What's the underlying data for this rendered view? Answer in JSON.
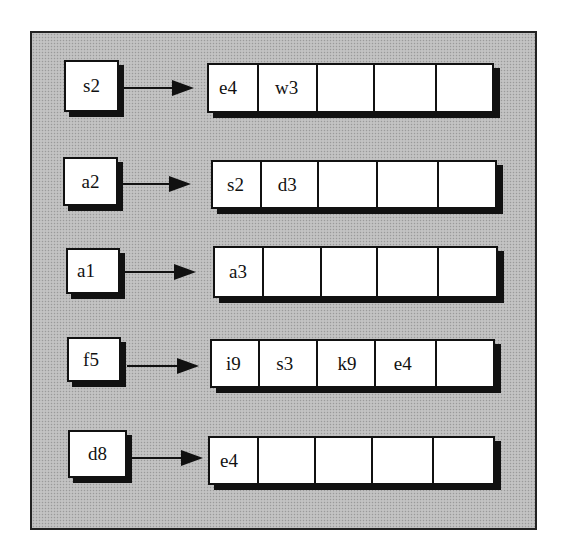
{
  "diagram": {
    "type": "hash-table-bucket-lists",
    "rows": [
      {
        "key": "s2",
        "cells": [
          "e4",
          "w3",
          "",
          "",
          ""
        ]
      },
      {
        "key": "a2",
        "cells": [
          "s2",
          "d3",
          "",
          "",
          ""
        ]
      },
      {
        "key": "a1",
        "cells": [
          "a3",
          "",
          "",
          "",
          ""
        ]
      },
      {
        "key": "f5",
        "cells": [
          "i9",
          "s3",
          "k9",
          "e4",
          ""
        ]
      },
      {
        "key": "d8",
        "cells": [
          "e4",
          "",
          "",
          "",
          ""
        ]
      }
    ]
  },
  "colors": {
    "background": "#bcbcbc",
    "box_fill": "#ffffff",
    "stroke": "#111111"
  }
}
